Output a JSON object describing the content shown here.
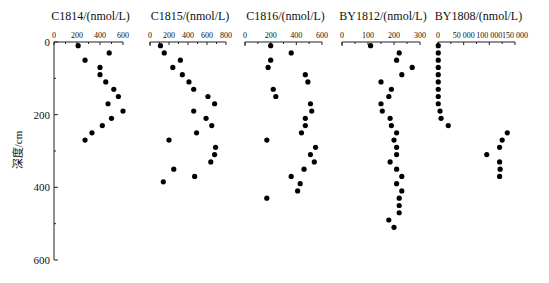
{
  "chart_data": {
    "type": "scatter",
    "ylabel": "深度/cm",
    "ylim": [
      0,
      600
    ],
    "y_inverted": true,
    "yticks": [
      0,
      200,
      400,
      600
    ],
    "grid": false,
    "legend": null,
    "panels": [
      {
        "title": "C1814/(nmol/L)",
        "xlim": [
          0,
          600
        ],
        "xticks": [
          0,
          200,
          400,
          600
        ],
        "xtick_labels": [
          "0",
          "200",
          "400",
          "600"
        ],
        "points": [
          {
            "x": 210,
            "depth": 10
          },
          {
            "x": 480,
            "depth": 30
          },
          {
            "x": 270,
            "depth": 50
          },
          {
            "x": 400,
            "depth": 70
          },
          {
            "x": 400,
            "depth": 90
          },
          {
            "x": 450,
            "depth": 110
          },
          {
            "x": 520,
            "depth": 130
          },
          {
            "x": 560,
            "depth": 150
          },
          {
            "x": 470,
            "depth": 170
          },
          {
            "x": 600,
            "depth": 190
          },
          {
            "x": 500,
            "depth": 210
          },
          {
            "x": 420,
            "depth": 230
          },
          {
            "x": 330,
            "depth": 250
          },
          {
            "x": 270,
            "depth": 270
          }
        ]
      },
      {
        "title": "C1815/(nmol/L)",
        "xlim": [
          0,
          800
        ],
        "xticks": [
          0,
          200,
          400,
          600,
          800
        ],
        "xtick_labels": [
          "0",
          "200",
          "400",
          "600",
          "800"
        ],
        "points": [
          {
            "x": 110,
            "depth": 10
          },
          {
            "x": 150,
            "depth": 30
          },
          {
            "x": 320,
            "depth": 50
          },
          {
            "x": 240,
            "depth": 70
          },
          {
            "x": 340,
            "depth": 90
          },
          {
            "x": 410,
            "depth": 110
          },
          {
            "x": 460,
            "depth": 130
          },
          {
            "x": 610,
            "depth": 150
          },
          {
            "x": 680,
            "depth": 170
          },
          {
            "x": 460,
            "depth": 190
          },
          {
            "x": 590,
            "depth": 210
          },
          {
            "x": 650,
            "depth": 230
          },
          {
            "x": 490,
            "depth": 250
          },
          {
            "x": 200,
            "depth": 270
          },
          {
            "x": 690,
            "depth": 290
          },
          {
            "x": 680,
            "depth": 310
          },
          {
            "x": 640,
            "depth": 330
          },
          {
            "x": 250,
            "depth": 350
          },
          {
            "x": 470,
            "depth": 370
          },
          {
            "x": 140,
            "depth": 385
          }
        ]
      },
      {
        "title": "C1816/(nmol/L)",
        "xlim": [
          0,
          600
        ],
        "xticks": [
          0,
          200,
          400,
          600
        ],
        "xtick_labels": [
          "0",
          "200",
          "400",
          "600"
        ],
        "points": [
          {
            "x": 200,
            "depth": 10
          },
          {
            "x": 360,
            "depth": 30
          },
          {
            "x": 200,
            "depth": 50
          },
          {
            "x": 180,
            "depth": 70
          },
          {
            "x": 470,
            "depth": 90
          },
          {
            "x": 490,
            "depth": 110
          },
          {
            "x": 220,
            "depth": 130
          },
          {
            "x": 240,
            "depth": 150
          },
          {
            "x": 510,
            "depth": 170
          },
          {
            "x": 520,
            "depth": 190
          },
          {
            "x": 470,
            "depth": 210
          },
          {
            "x": 470,
            "depth": 230
          },
          {
            "x": 440,
            "depth": 250
          },
          {
            "x": 170,
            "depth": 270
          },
          {
            "x": 550,
            "depth": 290
          },
          {
            "x": 510,
            "depth": 310
          },
          {
            "x": 540,
            "depth": 330
          },
          {
            "x": 460,
            "depth": 350
          },
          {
            "x": 360,
            "depth": 370
          },
          {
            "x": 430,
            "depth": 390
          },
          {
            "x": 410,
            "depth": 410
          },
          {
            "x": 170,
            "depth": 430
          }
        ]
      },
      {
        "title": "BY1812/(nmol/L)",
        "xlim": [
          0,
          300
        ],
        "xticks": [
          0,
          100,
          200,
          300
        ],
        "xtick_labels": [
          "0",
          "100",
          "200",
          "300"
        ],
        "points": [
          {
            "x": 110,
            "depth": 10
          },
          {
            "x": 220,
            "depth": 30
          },
          {
            "x": 210,
            "depth": 50
          },
          {
            "x": 270,
            "depth": 70
          },
          {
            "x": 230,
            "depth": 90
          },
          {
            "x": 150,
            "depth": 110
          },
          {
            "x": 190,
            "depth": 130
          },
          {
            "x": 180,
            "depth": 150
          },
          {
            "x": 150,
            "depth": 170
          },
          {
            "x": 155,
            "depth": 190
          },
          {
            "x": 185,
            "depth": 210
          },
          {
            "x": 190,
            "depth": 230
          },
          {
            "x": 210,
            "depth": 250
          },
          {
            "x": 200,
            "depth": 270
          },
          {
            "x": 210,
            "depth": 290
          },
          {
            "x": 210,
            "depth": 310
          },
          {
            "x": 185,
            "depth": 330
          },
          {
            "x": 210,
            "depth": 350
          },
          {
            "x": 230,
            "depth": 370
          },
          {
            "x": 210,
            "depth": 390
          },
          {
            "x": 230,
            "depth": 410
          },
          {
            "x": 220,
            "depth": 430
          },
          {
            "x": 220,
            "depth": 450
          },
          {
            "x": 220,
            "depth": 470
          },
          {
            "x": 180,
            "depth": 490
          },
          {
            "x": 200,
            "depth": 510
          }
        ]
      },
      {
        "title": "BY1808/(nmol/L)",
        "xlim": [
          0,
          150000
        ],
        "xticks": [
          0,
          50000,
          100000,
          150000
        ],
        "xtick_labels": [
          "0",
          "50 000",
          "100 000",
          "150 000"
        ],
        "points": [
          {
            "x": 500,
            "depth": 10
          },
          {
            "x": 500,
            "depth": 30
          },
          {
            "x": 500,
            "depth": 50
          },
          {
            "x": 500,
            "depth": 70
          },
          {
            "x": 500,
            "depth": 90
          },
          {
            "x": 500,
            "depth": 110
          },
          {
            "x": 500,
            "depth": 130
          },
          {
            "x": 500,
            "depth": 150
          },
          {
            "x": 500,
            "depth": 170
          },
          {
            "x": 4000,
            "depth": 190
          },
          {
            "x": 6000,
            "depth": 210
          },
          {
            "x": 20000,
            "depth": 230
          },
          {
            "x": 135000,
            "depth": 250
          },
          {
            "x": 125000,
            "depth": 270
          },
          {
            "x": 120000,
            "depth": 290
          },
          {
            "x": 95000,
            "depth": 310
          },
          {
            "x": 120000,
            "depth": 330
          },
          {
            "x": 121000,
            "depth": 350
          },
          {
            "x": 120000,
            "depth": 370
          }
        ]
      }
    ]
  },
  "layout": {
    "y_axis_x": 54,
    "y_zero_px": 42,
    "y_px_per_unit": 0.3633,
    "panel_x0": [
      54,
      150,
      245,
      342,
      438
    ],
    "panel_width": [
      69,
      76,
      77,
      78,
      77
    ],
    "dot_color": "#000000",
    "axis_color": "#222222"
  }
}
